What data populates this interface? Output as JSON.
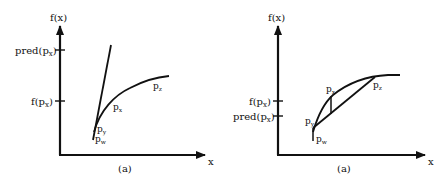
{
  "panels": [
    {
      "caption": "(a)",
      "y_axis_label": "f(x)",
      "x_axis_label": "x",
      "ticks": [
        {
          "label": "pred(p",
          "sub": "x",
          "close": ")"
        },
        {
          "label": "f(p",
          "sub": "x",
          "close": ")"
        }
      ],
      "points": {
        "px": "p",
        "px_sub": "x",
        "pz": "p",
        "pz_sub": "z",
        "py": "p",
        "py_sub": "y",
        "pw": "p",
        "pw_sub": "w"
      },
      "construction": "tangent line at p_y predicts pred(p_x) above f(p_x)"
    },
    {
      "caption": "(a)",
      "y_axis_label": "f(x)",
      "x_axis_label": "x",
      "ticks": [
        {
          "label": "f(p",
          "sub": "x",
          "close": ")"
        },
        {
          "label": "pred(p",
          "sub": "x",
          "close": ")"
        }
      ],
      "points": {
        "px": "p",
        "px_sub": "x",
        "pz": "p",
        "pz_sub": "z",
        "py": "p",
        "py_sub": "y",
        "pw": "p",
        "pw_sub": "w"
      },
      "construction": "chord p_y to p_z predicts pred(p_x) below f(p_x)"
    }
  ],
  "colors": {
    "ink": "#111111",
    "background": "#ffffff"
  }
}
